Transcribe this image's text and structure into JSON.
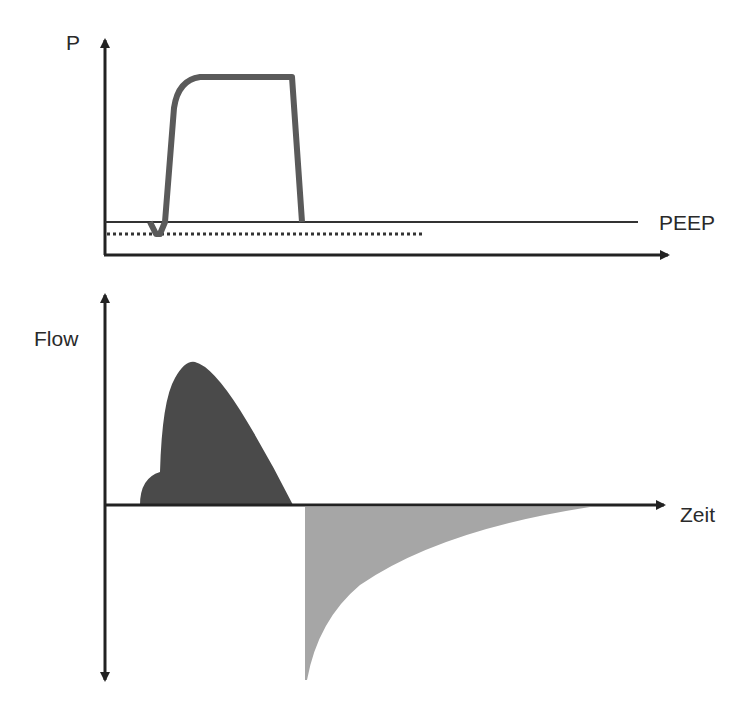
{
  "pressure_plot": {
    "y_label": "P",
    "baseline_label": "PEEP",
    "curve_color": "#5a5a5a",
    "axis_color": "#222222"
  },
  "flow_plot": {
    "y_label": "Flow",
    "x_label": "Zeit",
    "inspiration_fill": "#4a4a4a",
    "expiration_fill": "#a6a6a6"
  }
}
